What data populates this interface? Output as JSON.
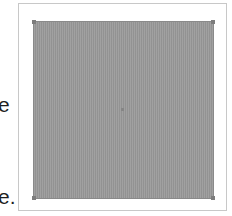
{
  "side_text": {
    "line1": "e",
    "line2": "e."
  },
  "image": {
    "fill_color": "#9a9a9a",
    "border_color": "#8a8a8a",
    "handles": [
      "top-left",
      "top-right",
      "bottom-left",
      "bottom-right"
    ]
  },
  "frame": {
    "border_color": "#c8c8c8"
  }
}
